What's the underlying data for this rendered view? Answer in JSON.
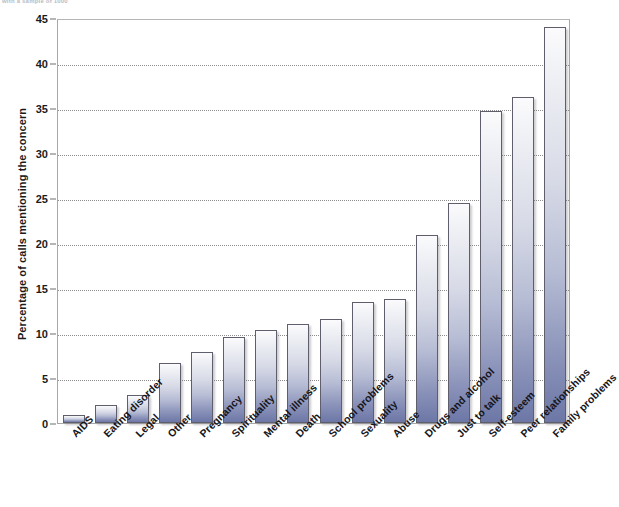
{
  "top_caption": "with a sample of 1000",
  "chart_data": {
    "type": "bar",
    "title": "",
    "xlabel": "",
    "ylabel": "Percentage of calls mentioning the concern",
    "ylim": [
      0,
      45
    ],
    "ytick_step": 5,
    "yticks": [
      0,
      5,
      10,
      15,
      20,
      25,
      30,
      35,
      40,
      45
    ],
    "grid": true,
    "legend": "none",
    "categories": [
      "AIDS",
      "Eating disorder",
      "Legal",
      "Other",
      "Pregnancy",
      "Spirituality",
      "Mental illness",
      "Death",
      "School problems",
      "Sexuality",
      "Abuse",
      "Drugs and alcohol",
      "Just to talk",
      "Self-esteem",
      "Peer relationships",
      "Family problems"
    ],
    "values": [
      0.9,
      2.0,
      3.1,
      6.7,
      7.9,
      9.6,
      10.3,
      11.0,
      11.6,
      13.4,
      13.8,
      20.9,
      24.4,
      34.7,
      36.2,
      44.0
    ]
  },
  "colors": {
    "bar_gradient_top": "#fbfbfd",
    "bar_gradient_bottom": "#6d77a6",
    "bar_border": "#5e5e6d",
    "axis": "#a8a8a8",
    "gridline": "#8d8d8d",
    "text": "#15151a",
    "background": "#ffffff"
  }
}
